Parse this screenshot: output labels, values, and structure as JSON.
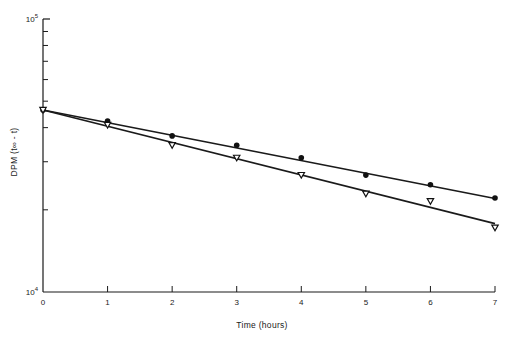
{
  "chart_data": {
    "type": "scatter",
    "title": "",
    "xlabel": "Time (hours)",
    "ylabel": "DPM (t∞ - t)",
    "yscale": "log",
    "xlim": [
      0,
      7
    ],
    "ylim": [
      10000,
      100000
    ],
    "x_ticks": [
      "0",
      "1",
      "2",
      "3",
      "4",
      "5",
      "6",
      "7"
    ],
    "y_tick_labels": [
      {
        "value": 10000,
        "base": "10",
        "exp": "4"
      },
      {
        "value": 100000,
        "base": "10",
        "exp": "5"
      }
    ],
    "y_minor_ticks": [
      20000,
      30000,
      40000,
      50000,
      60000,
      70000,
      80000,
      90000
    ],
    "grid": false,
    "legend": null,
    "series": [
      {
        "name": "filled circles",
        "marker": "circle-filled",
        "x": [
          0,
          1,
          2,
          3,
          4,
          5,
          6,
          7
        ],
        "values": [
          46400,
          42300,
          37300,
          34500,
          31000,
          26800,
          24700,
          22100
        ],
        "fit_line": {
          "x": [
            0,
            7
          ],
          "y": [
            46400,
            22000
          ]
        }
      },
      {
        "name": "open triangles",
        "marker": "triangle-down-open",
        "x": [
          0,
          1,
          2,
          3,
          4,
          5,
          6,
          7
        ],
        "values": [
          46400,
          40900,
          34500,
          31000,
          26800,
          22900,
          21500,
          17200
        ],
        "fit_line": {
          "x": [
            0,
            7
          ],
          "y": [
            46400,
            17800
          ]
        }
      }
    ]
  }
}
